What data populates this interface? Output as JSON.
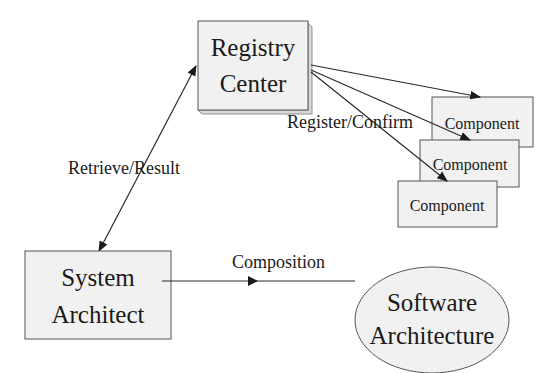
{
  "diagram": {
    "nodes": {
      "registry_center": {
        "line1": "Registry",
        "line2": "Center"
      },
      "components": [
        {
          "label": "Component"
        },
        {
          "label": "Component"
        },
        {
          "label": "Component"
        }
      ],
      "system_architect": {
        "line1": "System",
        "line2": "Architect"
      },
      "software_architecture": {
        "line1": "Software",
        "line2": "Architecture"
      }
    },
    "edges": {
      "retrieve_result": {
        "label": "Retrieve/Result"
      },
      "register_confirm": {
        "label": "Register/Confirm"
      },
      "composition": {
        "label": "Composition"
      }
    },
    "colors": {
      "box_fill": "#f1f1f1",
      "stroke": "#2a2a2a",
      "background": "#ffffff"
    }
  }
}
